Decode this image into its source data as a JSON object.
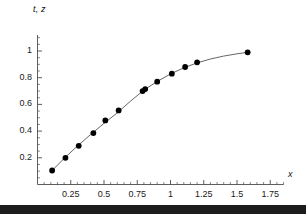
{
  "chart_data": {
    "type": "scatter",
    "title": "",
    "subtitle": "",
    "xlabel": "x",
    "ylabel": "t, z",
    "xlim": [
      0,
      1.85
    ],
    "ylim": [
      0,
      1.12
    ],
    "grid": false,
    "legend": null,
    "legend_position": "none",
    "xticks": [
      0.25,
      0.5,
      0.75,
      1,
      1.25,
      1.5,
      1.75
    ],
    "xtick_labels": [
      "0.25",
      "0.5",
      "0.75",
      "1",
      "1.25",
      "1.5",
      "1.75"
    ],
    "xminor_tick_step": 0.05,
    "yticks": [
      0.2,
      0.4,
      0.6,
      0.8,
      1
    ],
    "ytick_labels": [
      "0.2",
      "0.4",
      "0.6",
      "0.8",
      "1"
    ],
    "yminor_tick_step": 0.05,
    "marker": "filled-circle",
    "marker_color": "#000000",
    "line_color": "#555555",
    "axis_color": "#4d4d4d",
    "background_color": "#ffffff",
    "series": [
      {
        "name": "data points",
        "type": "scatter",
        "x": [
          0.11,
          0.21,
          0.31,
          0.42,
          0.51,
          0.61,
          0.79,
          0.81,
          0.9,
          1.01,
          1.11,
          1.2,
          1.58
        ],
        "y": [
          0.105,
          0.2,
          0.29,
          0.385,
          0.48,
          0.555,
          0.7,
          0.715,
          0.77,
          0.83,
          0.88,
          0.915,
          0.99
        ]
      },
      {
        "name": "fitted curve",
        "type": "line",
        "x": [
          0.11,
          0.2,
          0.3,
          0.4,
          0.5,
          0.6,
          0.7,
          0.8,
          0.9,
          1.0,
          1.1,
          1.2,
          1.3,
          1.4,
          1.5,
          1.58
        ],
        "y": [
          0.105,
          0.195,
          0.288,
          0.375,
          0.458,
          0.537,
          0.625,
          0.707,
          0.772,
          0.828,
          0.874,
          0.911,
          0.94,
          0.962,
          0.979,
          0.99
        ]
      }
    ]
  },
  "figure": {
    "bottom_bar_visible": true
  }
}
